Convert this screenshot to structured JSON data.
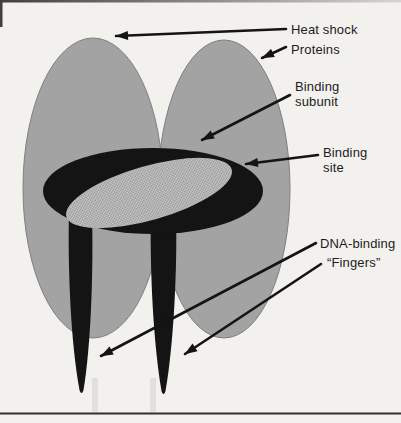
{
  "figure": {
    "type": "textbook-diagram"
  },
  "labels": {
    "heat_shock": "Heat shock",
    "proteins": "Proteins",
    "binding_subunit_line1": "Binding",
    "binding_subunit_line2": "subunit",
    "binding_site_line1": "Binding",
    "binding_site_line2": "site",
    "dna_binding_line1": "DNA-binding",
    "dna_binding_line2": "“Fingers”"
  },
  "colors": {
    "background": "#f3f1ee",
    "protein_gray": "#a3a3a3",
    "protein_outline": "#7f7f7f",
    "ink_black": "#141414",
    "stipple_light": "#d4d4d4",
    "stipple_dark": "#8f8f8f",
    "text": "#1c1c1c",
    "rule_line": "#2f2f2f",
    "top_strip_left": "#3f3f3f",
    "top_strip_right": "#d8d4d0"
  }
}
